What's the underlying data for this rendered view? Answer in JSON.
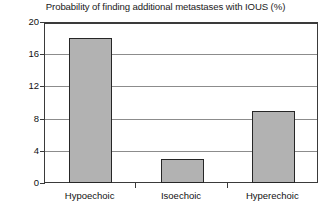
{
  "chart_data": {
    "type": "bar",
    "title": "Probability of finding additional metastases with IOUS (%)",
    "categories": [
      "Hypoechoic",
      "Isoechoic",
      "Hyperechoic"
    ],
    "values": [
      18,
      3,
      9
    ],
    "xlabel": "",
    "ylabel": "",
    "ylim": [
      0,
      20
    ],
    "yticks": [
      0,
      4,
      8,
      12,
      16,
      20
    ],
    "ytick_labels": [
      "0",
      "4",
      "8",
      "12",
      "16",
      "20"
    ],
    "grid": true,
    "grid_axis": "y",
    "legend": false,
    "bar_fill_color": "#b2b2b2",
    "bar_edge_color": "#262626",
    "gridline_color": "#8c8c8c",
    "axis_color": "#3a3a3a"
  }
}
